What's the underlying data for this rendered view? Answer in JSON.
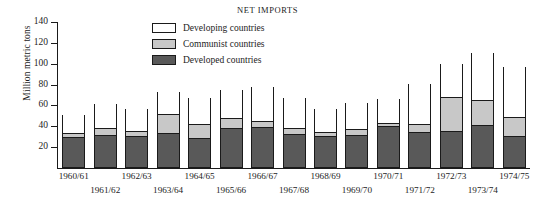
{
  "chart_data": {
    "type": "bar",
    "title": "NET IMPORTS",
    "xlabel": "",
    "ylabel": "Million metric tons",
    "ylim": [
      0,
      140
    ],
    "yticks": [
      0,
      20,
      40,
      60,
      80,
      100,
      120,
      140
    ],
    "ytick_labels": [
      "",
      "20",
      "40",
      "60",
      "80",
      "100",
      "120",
      "140"
    ],
    "grid": false,
    "stacked": true,
    "legend_position": "top-center",
    "categories": [
      "1960/61",
      "1961/62",
      "1962/63",
      "1963/64",
      "1964/65",
      "1965/66",
      "1966/67",
      "1967/68",
      "1968/69",
      "1969/70",
      "1970/71",
      "1971/72",
      "1972/73",
      "1973/74",
      "1974/75"
    ],
    "series": [
      {
        "name": "Developed countries",
        "color": "#595959",
        "values": [
          29,
          31,
          30,
          33,
          28,
          37,
          38,
          32,
          30,
          31,
          39,
          34,
          35,
          40,
          30
        ]
      },
      {
        "name": "Communist countries",
        "color": "#c8c8c8",
        "values": [
          4,
          6,
          5,
          18,
          13,
          10,
          6,
          5,
          4,
          5,
          3,
          7,
          32,
          24,
          18
        ]
      },
      {
        "name": "Developing countries",
        "color": "#ffffff",
        "values": [
          18,
          24,
          22,
          22,
          26,
          28,
          34,
          30,
          23,
          26,
          24,
          40,
          33,
          46,
          49
        ]
      }
    ],
    "totals": [
      51,
      61,
      57,
      73,
      67,
      75,
      78,
      67,
      57,
      62,
      66,
      81,
      100,
      110,
      97
    ]
  },
  "chart": {
    "title": "NET IMPORTS",
    "ylabel": "Million metric tons",
    "legend": [
      {
        "label": "Developing countries",
        "swatch": "white"
      },
      {
        "label": "Communist countries",
        "swatch": "light-gray"
      },
      {
        "label": "Developed countries",
        "swatch": "dark-gray"
      }
    ],
    "yticks": [
      "140",
      "120",
      "100",
      "80",
      "60",
      "40",
      "20"
    ],
    "xticks": [
      "1960/61",
      "1961/62",
      "1962/63",
      "1963/64",
      "1964/65",
      "1965/66",
      "1966/67",
      "1967/68",
      "1968/69",
      "1969/70",
      "1970/71",
      "1971/72",
      "1972/73",
      "1973/74",
      "1974/75"
    ]
  }
}
